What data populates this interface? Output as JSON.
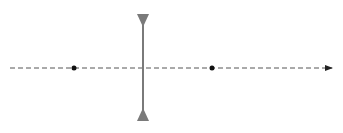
{
  "diagram": {
    "type": "diverging-lens",
    "colors": {
      "lens": "#7a7a7a",
      "axis": "#555555",
      "focal_point": "#111111",
      "background": "#ffffff"
    },
    "optical_axis": {
      "x1": 10,
      "x2": 333,
      "y": 68,
      "dashed": true,
      "arrow": "right"
    },
    "lens": {
      "x": 143,
      "top": 14,
      "bottom": 121
    },
    "focal_points": [
      {
        "name": "F1",
        "x": 74,
        "y": 68
      },
      {
        "name": "F2",
        "x": 212,
        "y": 68
      }
    ]
  }
}
